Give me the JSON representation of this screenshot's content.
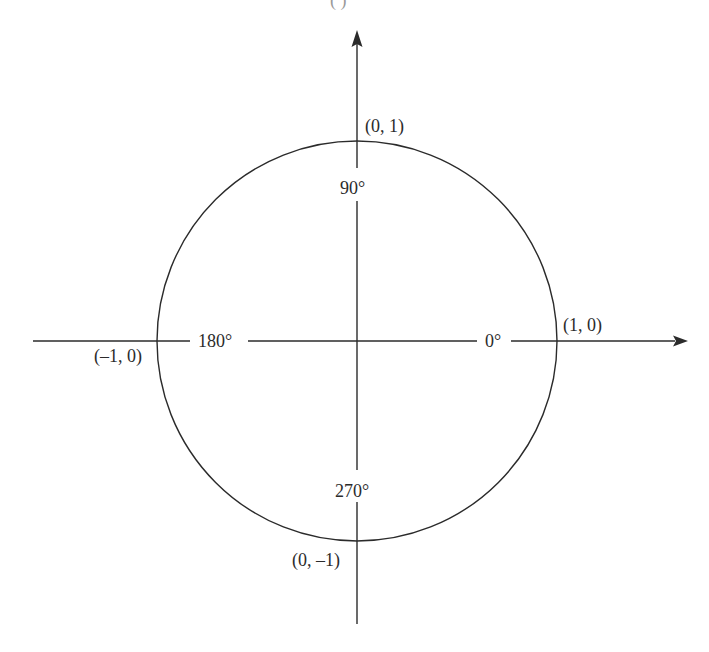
{
  "diagram": {
    "top_cut_text": "(             )",
    "circle": {
      "cx": 357,
      "cy": 341,
      "r": 200,
      "stroke": "#2b2b2b"
    },
    "axes": {
      "horizontal": {
        "y": 341,
        "x_start": 33,
        "x_end": 688
      },
      "vertical": {
        "x": 357,
        "y_start": 30,
        "y_end": 624
      }
    },
    "angle_labels": [
      {
        "id": "0",
        "text": "0°"
      },
      {
        "id": "90",
        "text": "90°"
      },
      {
        "id": "180",
        "text": "180°"
      },
      {
        "id": "270",
        "text": "270°"
      }
    ],
    "point_labels": [
      {
        "id": "right",
        "text": "(1, 0)"
      },
      {
        "id": "top",
        "text": "(0, 1)"
      },
      {
        "id": "left",
        "text": "(–1, 0)"
      },
      {
        "id": "bottom",
        "text": "(0, –1)"
      }
    ]
  }
}
